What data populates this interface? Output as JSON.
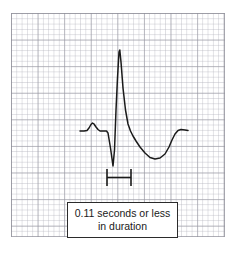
{
  "figure": {
    "name": "ecg-qrs-duration-diagram",
    "caption": "0.11 seconds or less in duration",
    "caption_line_1": "0.11 seconds or less in",
    "caption_line_2": "duration"
  },
  "colors": {
    "trace": "#1a1a1a",
    "grid_minor": "#afafb9",
    "grid_major": "#9696a0",
    "paper_background": "#ffffff",
    "caption_border": "#2b2b2b",
    "caption_text": "#1a1a1a"
  },
  "grid": {
    "label": "ecg-graph-paper",
    "x": 11,
    "y": 13,
    "width": 214,
    "height": 224,
    "minor_square_px": 5.32,
    "major_square_px": 26.6,
    "minor_per_major": 5
  },
  "measurement_bracket": {
    "label": "qrs-duration-bracket",
    "left_x": 107,
    "right_x": 131,
    "top_y": 169,
    "bottom_y": 186,
    "crossbar_y": 177.5,
    "measures": "QRS complex duration"
  },
  "chart_data": {
    "type": "line",
    "xlabel": "",
    "ylabel": "",
    "grid": true,
    "legend": "none",
    "baseline_y": 131,
    "waveform_name": "ecg-pqrst-trace",
    "annotations": [
      {
        "name": "qrs-duration-bracket",
        "text": "0.11 seconds or less in duration",
        "from_x": 107,
        "to_x": 131
      }
    ],
    "features": [
      {
        "name": "baseline-start",
        "x": 80,
        "y": 131
      },
      {
        "name": "p-wave-peak",
        "x": 92,
        "y": 123
      },
      {
        "name": "pr-segment",
        "x": 105,
        "y": 131
      },
      {
        "name": "q-wave-trough",
        "x": 113,
        "y": 166
      },
      {
        "name": "r-wave-peak",
        "x": 119,
        "y": 50
      },
      {
        "name": "s-wave-trough",
        "x": 155,
        "y": 159
      },
      {
        "name": "t-wave-return",
        "x": 178,
        "y": 130
      },
      {
        "name": "baseline-end",
        "x": 188,
        "y": 131
      }
    ],
    "points": [
      [
        80,
        131
      ],
      [
        84,
        131
      ],
      [
        87,
        130.5
      ],
      [
        89,
        128
      ],
      [
        91,
        124.5
      ],
      [
        92.5,
        123
      ],
      [
        94,
        124
      ],
      [
        96,
        127
      ],
      [
        98,
        129.5
      ],
      [
        100,
        131
      ],
      [
        104,
        131
      ],
      [
        106.5,
        131
      ],
      [
        108,
        133
      ],
      [
        110.5,
        148
      ],
      [
        113,
        166
      ],
      [
        114.5,
        150
      ],
      [
        116,
        110
      ],
      [
        117.5,
        78
      ],
      [
        119,
        52
      ],
      [
        119.8,
        50
      ],
      [
        121,
        62
      ],
      [
        123,
        88
      ],
      [
        125.5,
        110
      ],
      [
        128,
        124
      ],
      [
        130.5,
        131
      ],
      [
        133,
        136
      ],
      [
        136,
        141
      ],
      [
        140,
        147
      ],
      [
        145,
        153
      ],
      [
        150,
        157.5
      ],
      [
        155,
        159
      ],
      [
        160,
        158
      ],
      [
        165,
        154
      ],
      [
        169,
        147
      ],
      [
        172,
        140
      ],
      [
        175,
        134
      ],
      [
        178,
        130.5
      ],
      [
        181,
        129.5
      ],
      [
        185,
        130
      ],
      [
        188,
        130.5
      ]
    ]
  }
}
